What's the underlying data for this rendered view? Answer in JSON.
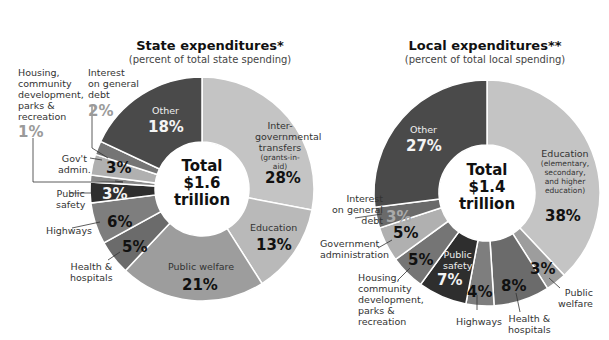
{
  "chart_data": [
    {
      "type": "pie",
      "title": "State expenditures*",
      "subtitle": "(percent of total state spending)",
      "center_label": [
        "Total",
        "$1.6",
        "trillion"
      ],
      "categories": [
        "Inter-governmental transfers (grants-in-aid)",
        "Education",
        "Public welfare",
        "Health & hospitals",
        "Highways",
        "Public safety",
        "Housing, community development, parks & recreation",
        "Gov't admin.",
        "Interest on general debt",
        "Other"
      ],
      "values": [
        28,
        13,
        21,
        5,
        6,
        3,
        1,
        3,
        2,
        18
      ],
      "colors": [
        "#c4c4c4",
        "#b9b9b9",
        "#9d9d9d",
        "#6b6b6b",
        "#7e7e7e",
        "#2e2e2e",
        "#8a8a8a",
        "#b0b0b0",
        "#757575",
        "#4a4a4a"
      ]
    },
    {
      "type": "pie",
      "title": "Local expenditures**",
      "subtitle": "(percent of total local spending)",
      "center_label": [
        "Total",
        "$1.4",
        "trillion"
      ],
      "categories": [
        "Education (elementary, secondary, and higher education)",
        "Public welfare",
        "Health & hospitals",
        "Highways",
        "Public safety",
        "Housing, community development, parks & recreation",
        "Government administration",
        "Interest on general debt",
        "Other"
      ],
      "values": [
        38,
        3,
        8,
        4,
        7,
        5,
        5,
        3,
        27
      ],
      "colors": [
        "#c4c4c4",
        "#9d9d9d",
        "#6b6b6b",
        "#7e7e7e",
        "#2e2e2e",
        "#757575",
        "#b0b0b0",
        "#6a6a6a",
        "#4a4a4a"
      ]
    }
  ],
  "state": {
    "title": "State expenditures*",
    "subtitle": "(percent of total state spending)",
    "total": "Total",
    "amount": "$1.6",
    "unit": "trillion",
    "labels": {
      "igt_1": "Inter-",
      "igt_2": "governmental",
      "igt_3": "transfers",
      "igt_4": "(grants-in-aid)",
      "igt_pct": "28%",
      "edu": "Education",
      "edu_pct": "13%",
      "welfare": "Public welfare",
      "welfare_pct": "21%",
      "health_1": "Health &",
      "health_2": "hospitals",
      "health_pct": "5%",
      "highways": "Highways",
      "highways_pct": "6%",
      "safety_1": "Public",
      "safety_2": "safety",
      "safety_pct": "3%",
      "admin_1": "Gov't",
      "admin_2": "admin.",
      "admin_pct": "3%",
      "housing_1": "Housing,",
      "housing_2": "community",
      "housing_3": "development,",
      "housing_4": "parks &",
      "housing_5": "recreation",
      "housing_pct": "1%",
      "interest_1": "Interest",
      "interest_2": "on general",
      "interest_3": "debt",
      "interest_pct": "2%",
      "other": "Other",
      "other_pct": "18%"
    }
  },
  "local": {
    "title": "Local expenditures**",
    "subtitle": "(percent of total local spending)",
    "total": "Total",
    "amount": "$1.4",
    "unit": "trillion",
    "labels": {
      "edu": "Education",
      "edu_1": "(elementary,",
      "edu_2": "secondary,",
      "edu_3": "and higher",
      "edu_4": "education)",
      "edu_pct": "38%",
      "welfare_1": "Public",
      "welfare_2": "welfare",
      "welfare_pct": "3%",
      "health_1": "Health &",
      "health_2": "hospitals",
      "health_pct": "8%",
      "highways": "Highways",
      "highways_pct": "4%",
      "safety_1": "Public",
      "safety_2": "safety",
      "safety_pct": "7%",
      "housing_1": "Housing,",
      "housing_2": "community",
      "housing_3": "development,",
      "housing_4": "parks &",
      "housing_5": "recreation",
      "housing_pct": "5%",
      "admin_1": "Government",
      "admin_2": "administration",
      "admin_pct": "5%",
      "interest_1": "Interest",
      "interest_2": "on general",
      "interest_3": "debt",
      "interest_pct": "3%",
      "other": "Other",
      "other_pct": "27%"
    }
  }
}
